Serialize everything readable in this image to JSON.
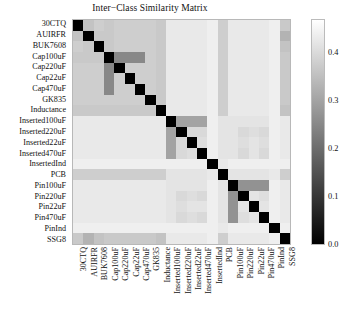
{
  "chart_data": {
    "type": "heatmap",
    "title": "Inter−Class Similarity Matrix",
    "xlabel": "",
    "ylabel": "",
    "colormap": "gray",
    "grid": false,
    "legend_position": "right-colorbar",
    "colorbar": {
      "ticks": [
        "0.0",
        "0.1",
        "0.2",
        "0.3",
        "0.4"
      ],
      "tick_values": [
        0.0,
        0.1,
        0.2,
        0.3,
        0.4
      ],
      "vmin": 0.0,
      "vmax": 0.47,
      "low_color": "#000000",
      "high_color": "#ffffff"
    },
    "categories": [
      "30CTQ",
      "AUIRFR",
      "BUK7608",
      "Cap100uF",
      "Cap220uF",
      "Cap22uF",
      "Cap470uF",
      "GK835",
      "Inductance",
      "Inserted100uF",
      "Inserted220uF",
      "Inserted22uF",
      "Inserted470uF",
      "InsertedInd",
      "PCB",
      "Pin100uF",
      "Pin220uF",
      "Pin22uF",
      "Pin470uF",
      "PinInd",
      "SSG8"
    ],
    "x_categories": [
      "30CTQ",
      "AUIRFR",
      "BUK7608",
      "Cap100uF",
      "Cap220uF",
      "Cap22uF",
      "Cap470uF",
      "GK835",
      "Inductance",
      "Inserted100uF",
      "Inserted220uF",
      "Inserted22uF",
      "Inserted470uF",
      "InsertedInd",
      "PCB",
      "Pin100uF",
      "Pin220uF",
      "Pin22uF",
      "Pin470uF",
      "PinInd",
      "SSG8"
    ],
    "y_categories": [
      "30CTQ",
      "AUIRFR",
      "BUK7608",
      "Cap100uF",
      "Cap220uF",
      "Cap22uF",
      "Cap470uF",
      "GK835",
      "Inductance",
      "Inserted100uF",
      "Inserted220uF",
      "Inserted22uF",
      "Inserted470uF",
      "InsertedInd",
      "PCB",
      "Pin100uF",
      "Pin220uF",
      "Pin22uF",
      "Pin470uF",
      "PinInd",
      "SSG8"
    ],
    "values": [
      [
        0.0,
        0.36,
        0.38,
        0.37,
        0.38,
        0.38,
        0.38,
        0.38,
        0.37,
        0.43,
        0.43,
        0.43,
        0.43,
        0.44,
        0.38,
        0.43,
        0.43,
        0.43,
        0.43,
        0.44,
        0.37
      ],
      [
        0.36,
        0.0,
        0.37,
        0.37,
        0.38,
        0.38,
        0.38,
        0.38,
        0.37,
        0.43,
        0.43,
        0.43,
        0.43,
        0.44,
        0.38,
        0.43,
        0.43,
        0.43,
        0.43,
        0.44,
        0.33
      ],
      [
        0.38,
        0.37,
        0.0,
        0.37,
        0.38,
        0.38,
        0.38,
        0.38,
        0.37,
        0.43,
        0.43,
        0.43,
        0.43,
        0.44,
        0.38,
        0.43,
        0.43,
        0.43,
        0.43,
        0.44,
        0.36
      ],
      [
        0.37,
        0.37,
        0.37,
        0.0,
        0.25,
        0.25,
        0.25,
        0.38,
        0.37,
        0.43,
        0.43,
        0.43,
        0.43,
        0.44,
        0.38,
        0.43,
        0.43,
        0.43,
        0.43,
        0.44,
        0.37
      ],
      [
        0.38,
        0.38,
        0.38,
        0.25,
        0.0,
        0.38,
        0.38,
        0.38,
        0.37,
        0.43,
        0.43,
        0.43,
        0.43,
        0.44,
        0.38,
        0.43,
        0.43,
        0.43,
        0.43,
        0.44,
        0.37
      ],
      [
        0.38,
        0.38,
        0.38,
        0.25,
        0.38,
        0.0,
        0.38,
        0.38,
        0.37,
        0.43,
        0.43,
        0.43,
        0.43,
        0.44,
        0.38,
        0.43,
        0.43,
        0.43,
        0.43,
        0.44,
        0.37
      ],
      [
        0.38,
        0.38,
        0.38,
        0.25,
        0.38,
        0.38,
        0.0,
        0.38,
        0.37,
        0.43,
        0.43,
        0.43,
        0.43,
        0.44,
        0.38,
        0.43,
        0.43,
        0.43,
        0.43,
        0.44,
        0.37
      ],
      [
        0.38,
        0.38,
        0.38,
        0.38,
        0.38,
        0.38,
        0.38,
        0.0,
        0.37,
        0.43,
        0.43,
        0.43,
        0.43,
        0.44,
        0.38,
        0.43,
        0.43,
        0.43,
        0.43,
        0.44,
        0.37
      ],
      [
        0.37,
        0.37,
        0.37,
        0.37,
        0.37,
        0.37,
        0.37,
        0.37,
        0.0,
        0.43,
        0.43,
        0.43,
        0.43,
        0.44,
        0.38,
        0.43,
        0.43,
        0.43,
        0.43,
        0.44,
        0.36
      ],
      [
        0.43,
        0.43,
        0.43,
        0.43,
        0.43,
        0.43,
        0.43,
        0.43,
        0.43,
        0.0,
        0.3,
        0.3,
        0.3,
        0.44,
        0.42,
        0.42,
        0.42,
        0.42,
        0.42,
        0.44,
        0.43
      ],
      [
        0.43,
        0.43,
        0.43,
        0.43,
        0.43,
        0.43,
        0.43,
        0.43,
        0.43,
        0.3,
        0.0,
        0.4,
        0.4,
        0.44,
        0.42,
        0.42,
        0.4,
        0.41,
        0.4,
        0.44,
        0.43
      ],
      [
        0.43,
        0.43,
        0.43,
        0.43,
        0.43,
        0.43,
        0.43,
        0.43,
        0.43,
        0.3,
        0.4,
        0.0,
        0.41,
        0.44,
        0.42,
        0.42,
        0.41,
        0.42,
        0.41,
        0.44,
        0.43
      ],
      [
        0.43,
        0.43,
        0.43,
        0.43,
        0.43,
        0.43,
        0.43,
        0.43,
        0.43,
        0.3,
        0.4,
        0.41,
        0.0,
        0.44,
        0.42,
        0.42,
        0.4,
        0.42,
        0.4,
        0.44,
        0.43
      ],
      [
        0.44,
        0.44,
        0.44,
        0.44,
        0.44,
        0.44,
        0.44,
        0.44,
        0.44,
        0.44,
        0.44,
        0.44,
        0.44,
        0.0,
        0.43,
        0.44,
        0.44,
        0.44,
        0.44,
        0.44,
        0.44
      ],
      [
        0.38,
        0.38,
        0.38,
        0.38,
        0.38,
        0.38,
        0.38,
        0.38,
        0.38,
        0.42,
        0.42,
        0.42,
        0.42,
        0.43,
        0.0,
        0.42,
        0.42,
        0.42,
        0.42,
        0.43,
        0.38
      ],
      [
        0.43,
        0.43,
        0.43,
        0.43,
        0.43,
        0.43,
        0.43,
        0.43,
        0.43,
        0.42,
        0.42,
        0.42,
        0.42,
        0.44,
        0.42,
        0.0,
        0.27,
        0.27,
        0.27,
        0.44,
        0.43
      ],
      [
        0.43,
        0.43,
        0.43,
        0.43,
        0.43,
        0.43,
        0.43,
        0.43,
        0.43,
        0.42,
        0.4,
        0.41,
        0.4,
        0.44,
        0.42,
        0.27,
        0.0,
        0.42,
        0.41,
        0.44,
        0.43
      ],
      [
        0.43,
        0.43,
        0.43,
        0.43,
        0.43,
        0.43,
        0.43,
        0.43,
        0.43,
        0.42,
        0.41,
        0.42,
        0.42,
        0.44,
        0.42,
        0.27,
        0.42,
        0.0,
        0.42,
        0.44,
        0.43
      ],
      [
        0.43,
        0.43,
        0.43,
        0.43,
        0.43,
        0.43,
        0.43,
        0.43,
        0.43,
        0.42,
        0.4,
        0.41,
        0.4,
        0.44,
        0.42,
        0.27,
        0.41,
        0.42,
        0.0,
        0.44,
        0.43
      ],
      [
        0.44,
        0.44,
        0.44,
        0.44,
        0.44,
        0.44,
        0.44,
        0.44,
        0.44,
        0.44,
        0.44,
        0.44,
        0.44,
        0.44,
        0.43,
        0.44,
        0.44,
        0.44,
        0.44,
        0.0,
        0.44
      ],
      [
        0.37,
        0.33,
        0.36,
        0.37,
        0.37,
        0.37,
        0.37,
        0.37,
        0.36,
        0.43,
        0.43,
        0.43,
        0.43,
        0.44,
        0.38,
        0.43,
        0.43,
        0.43,
        0.43,
        0.44,
        0.0
      ]
    ]
  }
}
